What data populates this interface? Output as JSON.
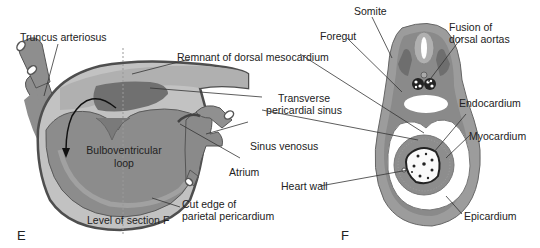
{
  "figure": {
    "panels": [
      {
        "id": "E",
        "letter": "E",
        "labels": {
          "truncus_arteriosus": "Truncus arteriosus",
          "remnant_dorsal_mesocardium": "Remnant of dorsal mesocardium",
          "transverse_pericardial_sinus_1": "Transverse",
          "transverse_pericardial_sinus_2": "pericardial sinus",
          "bulboventricular_loop_1": "Bulboventricular",
          "bulboventricular_loop_2": "loop",
          "sinus_venosus": "Sinus venosus",
          "atrium": "Atrium",
          "cut_edge_1": "Cut edge of",
          "cut_edge_2": "parietal pericardium",
          "level_of_section": "Level of section F"
        }
      },
      {
        "id": "F",
        "letter": "F",
        "labels": {
          "somite": "Somite",
          "foregut": "Foregut",
          "fusion_1": "Fusion of",
          "fusion_2": "dorsal aortas",
          "endocardium": "Endocardium",
          "myocardium": "Myocardium",
          "heart_wall": "Heart wall",
          "epicardium": "Epicardium"
        }
      }
    ],
    "colors": {
      "background": "#ffffff",
      "outline_dark": "#555555",
      "tissue_light": "#b8b8b8",
      "tissue_mid": "#9a9a9a",
      "tissue_dark": "#7a7a7a",
      "sinus_dark": "#6e6e6e",
      "leader_line": "#333333",
      "text": "#222222"
    }
  }
}
